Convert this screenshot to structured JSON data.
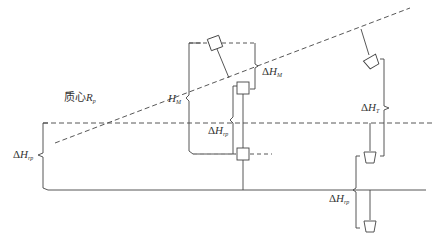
{
  "diagram": {
    "type": "technical-schematic",
    "colors": {
      "line": "#444444",
      "background": "#ffffff",
      "text": "#333333"
    },
    "labels": {
      "centroid": {
        "text": "质心",
        "var": "R",
        "sub": "p"
      },
      "H_M": {
        "prefix": "",
        "var": "H",
        "sub": "M"
      },
      "delta_H_M": {
        "prefix": "Δ",
        "var": "H",
        "sub": "M"
      },
      "delta_H_rp_mid": {
        "prefix": "Δ",
        "var": "H",
        "sub": "rp"
      },
      "delta_H_rp_left": {
        "prefix": "Δ",
        "var": "H",
        "sub": "rp"
      },
      "delta_H_T": {
        "prefix": "Δ",
        "var": "H",
        "sub": "T"
      },
      "delta_H_rp_right": {
        "prefix": "Δ",
        "var": "H",
        "sub": "rp"
      }
    },
    "elements": [
      "inclined-dashed-reference-line",
      "horizontal-dashed-reference-line",
      "solid-ground-line",
      "square-marker-inclined",
      "square-marker-upper",
      "square-marker-lower",
      "trapezoid-marker-inclined",
      "trapezoid-marker-mid",
      "trapezoid-marker-low"
    ]
  }
}
